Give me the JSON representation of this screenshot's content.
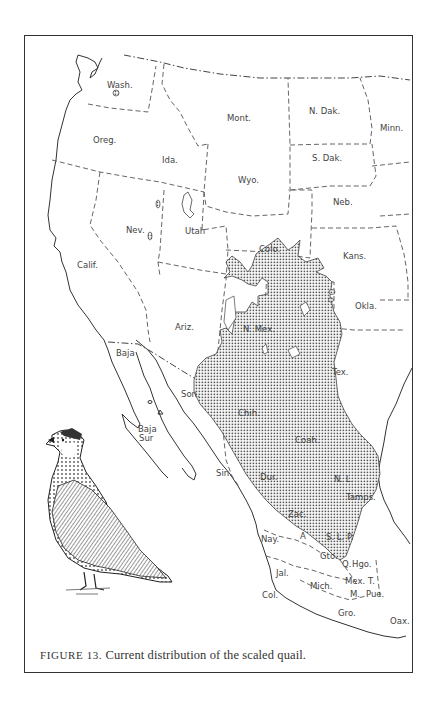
{
  "figure": {
    "caption_prefix": "FIGURE 13.",
    "caption_text": " Current distribution of the scaled quail.",
    "subject": "scaled quail",
    "illustration": "scaled-quail-drawing",
    "range_fill_pattern": "stipple-dots",
    "colors": {
      "ink": "#333333",
      "paper": "#ffffff",
      "stipple": "#555555"
    }
  },
  "map": {
    "us_states": [
      {
        "key": "wash",
        "label": "Wash."
      },
      {
        "key": "oreg",
        "label": "Oreg."
      },
      {
        "key": "calif",
        "label": "Calif."
      },
      {
        "key": "ida",
        "label": "Ida."
      },
      {
        "key": "nev",
        "label": "Nev."
      },
      {
        "key": "mont",
        "label": "Mont."
      },
      {
        "key": "wyo",
        "label": "Wyo."
      },
      {
        "key": "utah",
        "label": "Utah"
      },
      {
        "key": "colo",
        "label": "Colo."
      },
      {
        "key": "ariz",
        "label": "Ariz."
      },
      {
        "key": "nmex",
        "label": "N. Mex."
      },
      {
        "key": "ndak",
        "label": "N. Dak."
      },
      {
        "key": "sdak",
        "label": "S. Dak."
      },
      {
        "key": "neb",
        "label": "Neb."
      },
      {
        "key": "kans",
        "label": "Kans."
      },
      {
        "key": "okla",
        "label": "Okla."
      },
      {
        "key": "tex",
        "label": "Tex."
      },
      {
        "key": "minn",
        "label": "Minn."
      }
    ],
    "mexico_states": [
      {
        "key": "baja",
        "label": "Baja"
      },
      {
        "key": "bajasur1",
        "label": "Baja"
      },
      {
        "key": "bajasur2",
        "label": "Sur"
      },
      {
        "key": "son",
        "label": "Son."
      },
      {
        "key": "chih",
        "label": "Chih."
      },
      {
        "key": "coah",
        "label": "Coah."
      },
      {
        "key": "sin",
        "label": "Sin."
      },
      {
        "key": "dur",
        "label": "Dur."
      },
      {
        "key": "nl",
        "label": "N. L."
      },
      {
        "key": "tamps",
        "label": "Tamps."
      },
      {
        "key": "zac",
        "label": "Zac."
      },
      {
        "key": "nay",
        "label": "Nay."
      },
      {
        "key": "ags",
        "label": "A"
      },
      {
        "key": "slp",
        "label": "S. L. P."
      },
      {
        "key": "gto",
        "label": "Gto."
      },
      {
        "key": "q",
        "label": "Q."
      },
      {
        "key": "hgo",
        "label": "Hgo."
      },
      {
        "key": "jal",
        "label": "Jal."
      },
      {
        "key": "mich",
        "label": "Mich."
      },
      {
        "key": "mex",
        "label": "Mex."
      },
      {
        "key": "tlax",
        "label": "T."
      },
      {
        "key": "mor",
        "label": "M."
      },
      {
        "key": "pue",
        "label": "Pue."
      },
      {
        "key": "col",
        "label": "Col."
      },
      {
        "key": "gro",
        "label": "Gro."
      },
      {
        "key": "oax",
        "label": "Oax."
      }
    ]
  }
}
